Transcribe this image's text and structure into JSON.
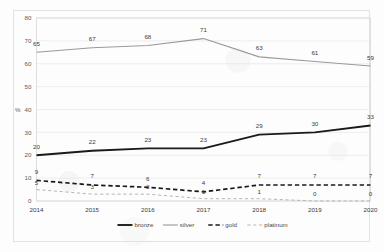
{
  "chart_data": {
    "type": "line",
    "title": "",
    "xlabel": "",
    "ylabel": "%",
    "categories": [
      "2014",
      "2015",
      "2016",
      "2017",
      "2018",
      "2019",
      "2020"
    ],
    "ylim": [
      0,
      80
    ],
    "yticks": [
      "0",
      "10",
      "20",
      "30",
      "40",
      "50",
      "60",
      "70",
      "80"
    ],
    "grid": true,
    "legend_position": "bottom",
    "series": [
      {
        "name": "bronze",
        "color": "#1a1a1a",
        "style": "solid",
        "width": 1.9,
        "values": [
          20,
          22,
          23,
          23,
          29,
          30,
          33
        ],
        "labels": [
          "20",
          "22",
          "23",
          "23",
          "29",
          "30",
          "33"
        ]
      },
      {
        "name": "silver",
        "color": "#9a9a9a",
        "style": "solid",
        "width": 1.1,
        "values": [
          65,
          67,
          68,
          71,
          63,
          61,
          59
        ],
        "labels": [
          "65",
          "67",
          "68",
          "71",
          "63",
          "61",
          "59"
        ]
      },
      {
        "name": "gold",
        "color": "#1a1a1a",
        "style": "dashed",
        "width": 1.7,
        "values": [
          9,
          7,
          6,
          4,
          7,
          7,
          7
        ],
        "labels": [
          "9",
          "7",
          "6",
          "4",
          "7",
          "7",
          "7"
        ]
      },
      {
        "name": "platinum",
        "color": "#b5b5b5",
        "style": "dashed",
        "width": 1.0,
        "values": [
          5,
          3,
          3,
          1,
          1,
          0,
          0
        ],
        "labels": [
          "5",
          "3",
          "3",
          "1",
          "1",
          "0",
          "0"
        ]
      }
    ]
  },
  "axis": {
    "y_unit_label": "%",
    "y_tick_labels": [
      "80",
      "70",
      "60",
      "50",
      "40",
      "30",
      "20",
      "10",
      "0"
    ],
    "x_tick_labels": [
      "2014",
      "2015",
      "2016",
      "2017",
      "2018",
      "2019",
      "2020"
    ]
  },
  "legend": {
    "items": [
      {
        "label": "bronze"
      },
      {
        "label": "silver"
      },
      {
        "label": "gold"
      },
      {
        "label": "platinum"
      }
    ]
  }
}
